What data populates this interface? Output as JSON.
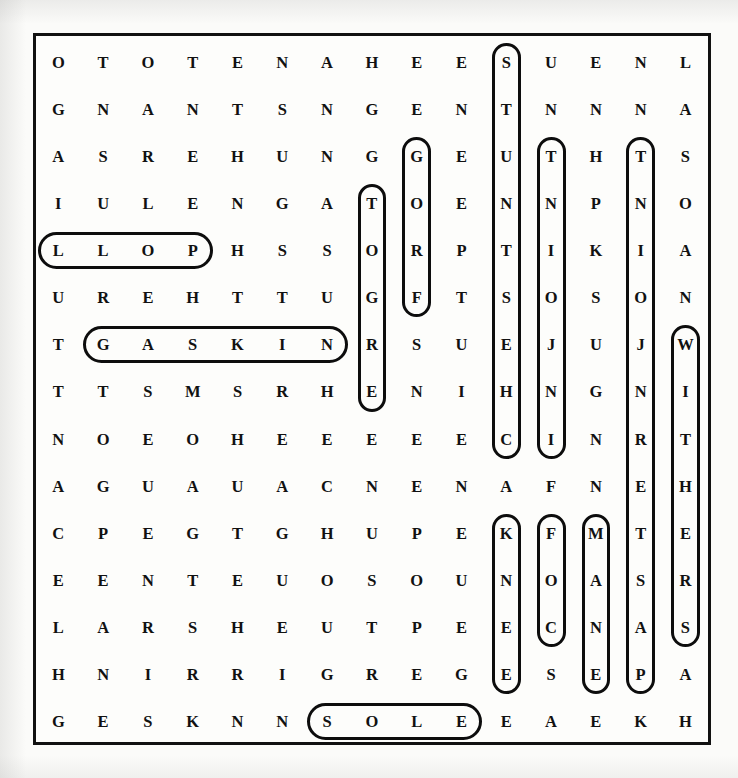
{
  "puzzle": {
    "title": "Word Search Puzzle Grid",
    "rows": 15,
    "cols": 15,
    "letter_color": "#111111",
    "border_color": "#111111",
    "background_color": "#fdfdfb",
    "marker_color": "#0d0d0d",
    "grid": [
      [
        "O",
        "T",
        "O",
        "T",
        "E",
        "N",
        "A",
        "H",
        "E",
        "E",
        "S",
        "U",
        "E",
        "N",
        "L"
      ],
      [
        "G",
        "N",
        "A",
        "N",
        "T",
        "S",
        "N",
        "G",
        "E",
        "N",
        "T",
        "N",
        "N",
        "N",
        "A"
      ],
      [
        "A",
        "S",
        "R",
        "E",
        "H",
        "U",
        "N",
        "G",
        "G",
        "E",
        "U",
        "T",
        "H",
        "T",
        "S"
      ],
      [
        "I",
        "U",
        "L",
        "E",
        "N",
        "G",
        "A",
        "T",
        "O",
        "E",
        "N",
        "N",
        "P",
        "N",
        "O"
      ],
      [
        "L",
        "L",
        "O",
        "P",
        "H",
        "S",
        "S",
        "O",
        "R",
        "P",
        "T",
        "I",
        "K",
        "I",
        "A"
      ],
      [
        "U",
        "R",
        "E",
        "H",
        "T",
        "T",
        "U",
        "G",
        "F",
        "T",
        "S",
        "O",
        "S",
        "O",
        "N"
      ],
      [
        "T",
        "G",
        "A",
        "S",
        "K",
        "I",
        "N",
        "R",
        "S",
        "U",
        "E",
        "J",
        "U",
        "J",
        "W"
      ],
      [
        "T",
        "T",
        "S",
        "M",
        "S",
        "R",
        "H",
        "E",
        "N",
        "I",
        "H",
        "N",
        "G",
        "N",
        "I"
      ],
      [
        "N",
        "O",
        "E",
        "O",
        "H",
        "E",
        "E",
        "E",
        "E",
        "E",
        "C",
        "I",
        "N",
        "R",
        "T"
      ],
      [
        "A",
        "G",
        "U",
        "A",
        "U",
        "A",
        "C",
        "N",
        "E",
        "N",
        "A",
        "F",
        "N",
        "E",
        "H"
      ],
      [
        "C",
        "P",
        "E",
        "G",
        "T",
        "G",
        "H",
        "U",
        "P",
        "E",
        "K",
        "F",
        "M",
        "T",
        "E"
      ],
      [
        "E",
        "E",
        "N",
        "T",
        "E",
        "U",
        "O",
        "S",
        "O",
        "U",
        "N",
        "O",
        "A",
        "S",
        "R"
      ],
      [
        "L",
        "A",
        "R",
        "S",
        "H",
        "E",
        "U",
        "T",
        "P",
        "E",
        "E",
        "C",
        "N",
        "A",
        "S"
      ],
      [
        "H",
        "N",
        "I",
        "R",
        "R",
        "I",
        "G",
        "R",
        "E",
        "G",
        "E",
        "S",
        "E",
        "P",
        "A"
      ],
      [
        "G",
        "E",
        "S",
        "K",
        "N",
        "N",
        "S",
        "O",
        "L",
        "E",
        "E",
        "A",
        "E",
        "K",
        "H"
      ]
    ],
    "found_words": [
      {
        "name": "poll-reversed",
        "text": "LLOP",
        "direction": "horizontal",
        "row": 5,
        "col_start": 1,
        "col_end": 4
      },
      {
        "name": "gaskin",
        "text": "GASKIN",
        "direction": "horizontal",
        "row": 7,
        "col_start": 2,
        "col_end": 7
      },
      {
        "name": "sole",
        "text": "SOLE",
        "direction": "horizontal",
        "row": 15,
        "col_start": 7,
        "col_end": 10
      },
      {
        "name": "ergot-reversed",
        "text": "TOGRE",
        "direction": "vertical",
        "col": 8,
        "row_start": 4,
        "row_end": 8
      },
      {
        "name": "frog-reversed",
        "text": "GORF",
        "direction": "vertical",
        "col": 9,
        "row_start": 3,
        "row_end": 6
      },
      {
        "name": "chestnuts-reversed",
        "text": "STUNTSEHC",
        "direction": "vertical",
        "col": 11,
        "row_start": 1,
        "row_end": 9
      },
      {
        "name": "knee",
        "text": "KNEE",
        "direction": "vertical",
        "col": 11,
        "row_start": 11,
        "row_end": 14
      },
      {
        "name": "injoint-reversed",
        "text": "TNIOJNI",
        "direction": "vertical",
        "col": 12,
        "row_start": 3,
        "row_end": 9
      },
      {
        "name": "cof-segment",
        "text": "FOC",
        "direction": "vertical",
        "col": 12,
        "row_start": 11,
        "row_end": 13
      },
      {
        "name": "mane",
        "text": "MANE",
        "direction": "vertical",
        "col": 13,
        "row_start": 11,
        "row_end": 14
      },
      {
        "name": "pastern-reversed",
        "text": "TNOIUJNRETSAPE",
        "direction": "vertical",
        "col": 14,
        "row_start": 3,
        "row_end": 14
      },
      {
        "name": "withers",
        "text": "WITHERS",
        "direction": "vertical",
        "col": 15,
        "row_start": 7,
        "row_end": 13
      }
    ]
  }
}
